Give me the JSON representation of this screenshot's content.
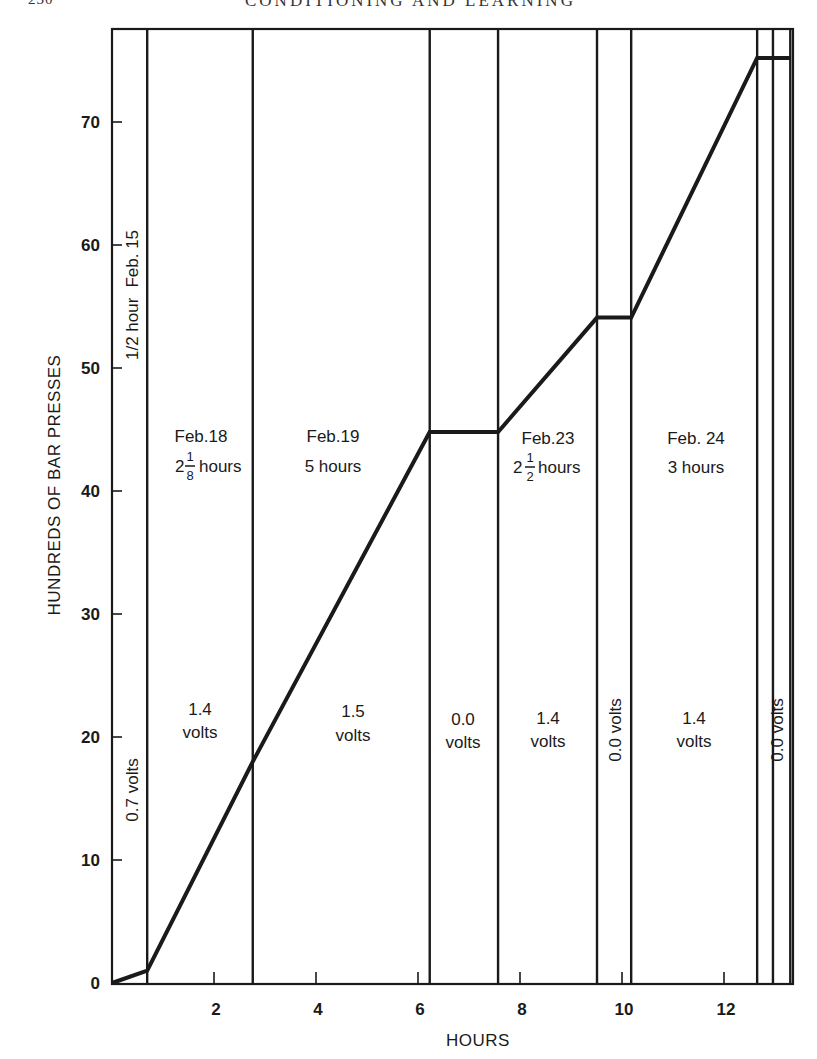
{
  "page": {
    "page_number": "230",
    "running_head": "CONDITIONING AND LEARNING"
  },
  "chart_data": {
    "type": "line",
    "title": "",
    "xlabel": "HOURS",
    "ylabel": "HUNDREDS OF BAR PRESSES",
    "xlim": [
      0,
      13.3
    ],
    "ylim": [
      0,
      78
    ],
    "x_ticks": [
      2,
      4,
      6,
      8,
      10,
      12
    ],
    "x_tick_labels": [
      "2",
      "4",
      "6",
      "8",
      "10",
      "12"
    ],
    "y_ticks": [
      0,
      10,
      20,
      30,
      40,
      50,
      60,
      70
    ],
    "y_tick_labels": [
      "0",
      "10",
      "20",
      "30",
      "40",
      "50",
      "60",
      "70"
    ],
    "grid": false,
    "legend": null,
    "series": [
      {
        "name": "Cumulative bar presses",
        "x": [
          0,
          0.69,
          2.76,
          6.23,
          7.57,
          9.51,
          10.18,
          12.65,
          13.3
        ],
        "y": [
          0,
          1.0,
          18.0,
          44.8,
          44.8,
          54.1,
          54.1,
          75.2,
          75.2
        ]
      }
    ],
    "session_boundaries_hours": [
      0,
      0.69,
      2.76,
      6.23,
      7.57,
      9.51,
      10.18,
      12.65,
      12.96,
      13.3
    ],
    "sessions": [
      {
        "date": "Feb. 15",
        "duration": "1/2 hour",
        "voltage": "0.7 volts",
        "x_start": 0,
        "x_end": 0.69,
        "vertical_text": true
      },
      {
        "date": "Feb.18",
        "duration_whole": "2",
        "duration_num": "1",
        "duration_den": "8",
        "duration_unit": "hours",
        "voltage_value": "1.4",
        "voltage_unit": "volts",
        "x_start": 0.69,
        "x_end": 2.76
      },
      {
        "date": "Feb.19",
        "duration": "5 hours",
        "voltage_value": "1.5",
        "voltage_unit": "volts",
        "x_start": 2.76,
        "x_end": 6.23
      },
      {
        "date": "",
        "duration": "",
        "voltage_value": "0.0",
        "voltage_unit": "volts",
        "x_start": 6.23,
        "x_end": 7.57
      },
      {
        "date": "Feb.23",
        "duration_whole": "2",
        "duration_num": "1",
        "duration_den": "2",
        "duration_unit": "hours",
        "voltage_value": "1.4",
        "voltage_unit": "volts",
        "x_start": 7.57,
        "x_end": 9.51
      },
      {
        "date": "",
        "duration": "",
        "voltage": "0.0 volts",
        "x_start": 9.51,
        "x_end": 10.18,
        "vertical_text": true
      },
      {
        "date": "Feb. 24",
        "duration": "3 hours",
        "voltage_value": "1.4",
        "voltage_unit": "volts",
        "x_start": 10.18,
        "x_end": 12.65
      },
      {
        "date": "",
        "duration": "",
        "voltage": "0.0 volts",
        "x_start": 12.65,
        "x_end": 12.96,
        "vertical_text": true
      }
    ]
  }
}
